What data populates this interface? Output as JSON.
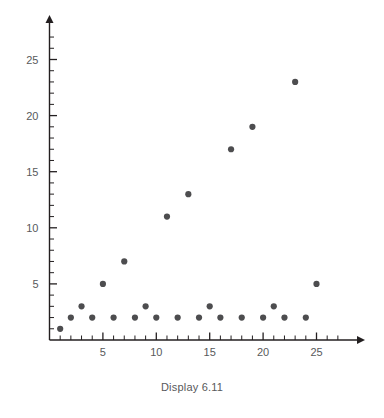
{
  "caption": "Display 6.11",
  "colors": {
    "point": "#4d4d4f",
    "axis": "#231f20",
    "tick_label": "#58595b",
    "caption": "#58595b",
    "background": "#ffffff"
  },
  "chart_data": {
    "type": "scatter",
    "title": "",
    "xlabel": "",
    "ylabel": "",
    "xlim": [
      0,
      28
    ],
    "ylim": [
      0,
      28
    ],
    "grid": false,
    "legend": null,
    "x_ticks_major": [
      5,
      10,
      15,
      20,
      25
    ],
    "x_tick_labels": [
      "5",
      "10",
      "15",
      "20",
      "25"
    ],
    "x_ticks_minor": [
      1,
      2,
      3,
      4,
      6,
      7,
      8,
      9,
      11,
      12,
      13,
      14,
      16,
      17,
      18,
      19,
      21,
      22,
      23,
      24,
      26,
      27
    ],
    "y_ticks_major": [
      5,
      10,
      15,
      20,
      25
    ],
    "y_tick_labels": [
      "5",
      "10",
      "15",
      "20",
      "25"
    ],
    "y_ticks_minor": [
      1,
      2,
      3,
      4,
      6,
      7,
      8,
      9,
      11,
      12,
      13,
      14,
      16,
      17,
      18,
      19,
      21,
      22,
      23,
      24,
      26,
      27
    ],
    "x": [
      1,
      2,
      3,
      4,
      5,
      6,
      7,
      8,
      9,
      10,
      11,
      12,
      13,
      14,
      15,
      16,
      17,
      18,
      19,
      20,
      21,
      22,
      23,
      24,
      25
    ],
    "y": [
      1,
      2,
      3,
      2,
      5,
      2,
      7,
      2,
      3,
      2,
      11,
      2,
      13,
      2,
      3,
      2,
      17,
      2,
      19,
      2,
      3,
      2,
      23,
      2,
      5
    ],
    "points": [
      {
        "x": 1,
        "y": 1
      },
      {
        "x": 2,
        "y": 2
      },
      {
        "x": 3,
        "y": 3
      },
      {
        "x": 4,
        "y": 2
      },
      {
        "x": 5,
        "y": 5
      },
      {
        "x": 6,
        "y": 2
      },
      {
        "x": 7,
        "y": 7
      },
      {
        "x": 8,
        "y": 2
      },
      {
        "x": 9,
        "y": 3
      },
      {
        "x": 10,
        "y": 2
      },
      {
        "x": 11,
        "y": 11
      },
      {
        "x": 12,
        "y": 2
      },
      {
        "x": 13,
        "y": 13
      },
      {
        "x": 14,
        "y": 2
      },
      {
        "x": 15,
        "y": 3
      },
      {
        "x": 16,
        "y": 2
      },
      {
        "x": 17,
        "y": 17
      },
      {
        "x": 18,
        "y": 2
      },
      {
        "x": 19,
        "y": 19
      },
      {
        "x": 20,
        "y": 2
      },
      {
        "x": 21,
        "y": 3
      },
      {
        "x": 22,
        "y": 2
      },
      {
        "x": 23,
        "y": 23
      },
      {
        "x": 24,
        "y": 2
      },
      {
        "x": 25,
        "y": 5
      }
    ]
  }
}
